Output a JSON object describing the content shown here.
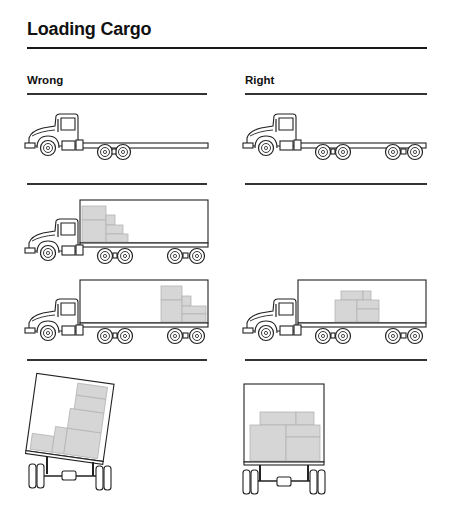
{
  "title": "Loading Cargo",
  "columns": {
    "wrong": {
      "label": "Wrong"
    },
    "right": {
      "label": "Right"
    }
  },
  "figures": [
    {
      "id": "wrong-flatbed",
      "column": "Wrong",
      "description": "Truck cab with long flatbed chassis, two rear axles only"
    },
    {
      "id": "right-flatbed",
      "column": "Right",
      "description": "Truck cab with flatbed chassis supported by two tandem axle groups"
    },
    {
      "id": "wrong-front-load",
      "column": "Wrong",
      "description": "Box trailer with cargo stacked at front against cab"
    },
    {
      "id": "wrong-rear-load",
      "column": "Wrong",
      "description": "Box trailer with cargo stacked at rear end"
    },
    {
      "id": "right-center-load",
      "column": "Right",
      "description": "Box trailer with cargo centered between axles"
    },
    {
      "id": "wrong-side-load",
      "column": "Wrong",
      "description": "Rear view: cargo stacked on one side, trailer tilting"
    },
    {
      "id": "right-even-load",
      "column": "Right",
      "description": "Rear view: cargo evenly distributed, trailer level"
    }
  ],
  "colors": {
    "cargo": "#d6d6d6",
    "line": "#222222",
    "background": "#ffffff"
  }
}
